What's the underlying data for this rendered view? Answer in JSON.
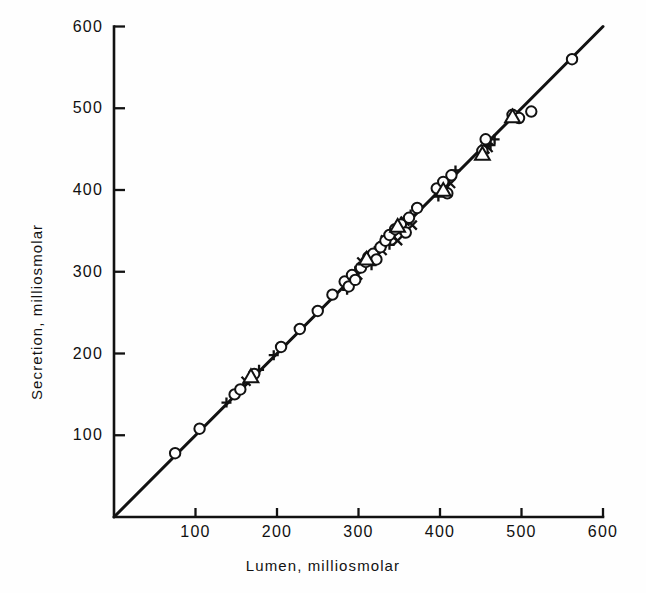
{
  "figure": {
    "background_color": "#fefefe",
    "ink_color": "#121212"
  },
  "chart_data": {
    "type": "scatter",
    "title": "",
    "xlabel": "Lumen, milliosmolar",
    "ylabel": "Secretion, milliosmolar",
    "xlim": [
      0,
      600
    ],
    "ylim": [
      0,
      600
    ],
    "xticks": [
      100,
      200,
      300,
      400,
      500,
      600
    ],
    "yticks": [
      100,
      200,
      300,
      400,
      500,
      600
    ],
    "xtick_labels": [
      "100",
      "200",
      "300",
      "400",
      "500",
      "600"
    ],
    "ytick_labels": [
      "100",
      "200",
      "300",
      "400",
      "500",
      "600"
    ],
    "grid": false,
    "legend": "none",
    "annotations": [],
    "reference_line": {
      "name": "identity-line",
      "description": "line of identity, secretion = lumen",
      "from": [
        0,
        0
      ],
      "to": [
        600,
        600
      ],
      "slope": 1,
      "intercept": 0
    },
    "series": [
      {
        "name": "circle-series",
        "marker": "open-circle",
        "points": [
          [
            75,
            78
          ],
          [
            105,
            108
          ],
          [
            148,
            150
          ],
          [
            155,
            156
          ],
          [
            172,
            175
          ],
          [
            205,
            208
          ],
          [
            228,
            230
          ],
          [
            250,
            252
          ],
          [
            268,
            272
          ],
          [
            283,
            288
          ],
          [
            288,
            282
          ],
          [
            292,
            296
          ],
          [
            296,
            290
          ],
          [
            303,
            305
          ],
          [
            309,
            312
          ],
          [
            312,
            318
          ],
          [
            318,
            322
          ],
          [
            322,
            315
          ],
          [
            327,
            330
          ],
          [
            333,
            338
          ],
          [
            338,
            345
          ],
          [
            345,
            352
          ],
          [
            352,
            358
          ],
          [
            358,
            348
          ],
          [
            362,
            366
          ],
          [
            372,
            378
          ],
          [
            396,
            402
          ],
          [
            404,
            410
          ],
          [
            409,
            396
          ],
          [
            414,
            418
          ],
          [
            452,
            448
          ],
          [
            456,
            462
          ],
          [
            489,
            492
          ],
          [
            497,
            488
          ],
          [
            512,
            496
          ],
          [
            562,
            560
          ]
        ]
      },
      {
        "name": "triangle-series",
        "marker": "open-triangle",
        "points": [
          [
            168,
            172
          ],
          [
            310,
            316
          ],
          [
            348,
            356
          ],
          [
            404,
            400
          ],
          [
            452,
            444
          ],
          [
            489,
            490
          ]
        ]
      },
      {
        "name": "plus-series",
        "marker": "plus",
        "points": [
          [
            138,
            140
          ],
          [
            178,
            180
          ],
          [
            196,
            198
          ],
          [
            286,
            278
          ],
          [
            296,
            300
          ],
          [
            301,
            306
          ],
          [
            307,
            310
          ],
          [
            313,
            316
          ],
          [
            316,
            308
          ],
          [
            320,
            325
          ],
          [
            325,
            330
          ],
          [
            330,
            336
          ],
          [
            334,
            342
          ],
          [
            338,
            333
          ],
          [
            342,
            348
          ],
          [
            346,
            353
          ],
          [
            352,
            360
          ],
          [
            356,
            347
          ],
          [
            364,
            370
          ],
          [
            398,
            392
          ],
          [
            419,
            424
          ],
          [
            462,
            455
          ],
          [
            467,
            462
          ]
        ]
      },
      {
        "name": "cross-series",
        "marker": "x-mark",
        "points": [
          [
            162,
            166
          ],
          [
            299,
            296
          ],
          [
            304,
            312
          ],
          [
            317,
            320
          ],
          [
            329,
            326
          ],
          [
            333,
            339
          ],
          [
            341,
            344
          ],
          [
            348,
            338
          ],
          [
            357,
            362
          ],
          [
            366,
            357
          ],
          [
            408,
            404
          ],
          [
            413,
            408
          ],
          [
            455,
            450
          ],
          [
            459,
            452
          ]
        ]
      }
    ]
  }
}
